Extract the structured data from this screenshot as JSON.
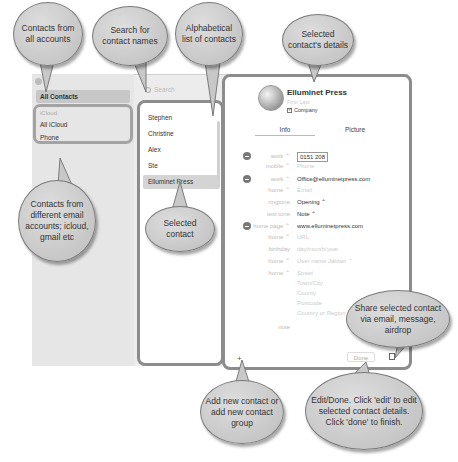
{
  "sidebar": {
    "all_contacts": "All Contacts",
    "group_header": "iCloud",
    "items": [
      {
        "label": "All iCloud"
      },
      {
        "label": "Phone"
      }
    ]
  },
  "search": {
    "placeholder": "Search"
  },
  "contact_list": {
    "items": [
      {
        "label": "Stephen"
      },
      {
        "label": "Christine"
      },
      {
        "label": "Alex"
      },
      {
        "label": "Ste"
      },
      {
        "label": "Elluminet Press",
        "selected": true
      }
    ]
  },
  "detail": {
    "name": "Elluminet Press",
    "subtitle": "First  Last",
    "company_label": "Company",
    "tabs": [
      {
        "label": "Info"
      },
      {
        "label": "Picture"
      }
    ],
    "rows": [
      {
        "removable": true,
        "label": "work ⌃",
        "value": "0151 208",
        "editing": true
      },
      {
        "removable": false,
        "label": "mobile ⌃",
        "value": "Phone",
        "placeholder": true
      },
      {
        "removable": true,
        "label": "work ⌃",
        "value": "Office@elluminetpress.com"
      },
      {
        "removable": false,
        "label": "home ⌃",
        "value": "Email",
        "placeholder": true
      },
      {
        "removable": false,
        "label": "ringtone",
        "value": "Opening ⌃"
      },
      {
        "removable": false,
        "label": "text tone",
        "value": "Note ⌃"
      },
      {
        "removable": true,
        "label": "home page ⌃",
        "value": "www.elluminetpress.com"
      },
      {
        "removable": false,
        "label": "home ⌃",
        "value": "URL",
        "placeholder": true
      },
      {
        "removable": false,
        "label": "birthday",
        "value": "day/month/year",
        "placeholder": true
      },
      {
        "removable": false,
        "label": "home ⌃",
        "value": "User name   Jabber ⌃",
        "placeholder": true
      },
      {
        "removable": false,
        "label": "home ⌃",
        "value": "Street",
        "placeholder": true
      },
      {
        "removable": false,
        "label": "",
        "value": "Town/City",
        "placeholder": true
      },
      {
        "removable": false,
        "label": "",
        "value": "County",
        "placeholder": true
      },
      {
        "removable": false,
        "label": "",
        "value": "Postcode",
        "placeholder": true
      },
      {
        "removable": false,
        "label": "",
        "value": "Country or Region",
        "placeholder": true
      },
      {
        "removable": false,
        "label": "note",
        "value": "",
        "placeholder": true
      }
    ]
  },
  "footer": {
    "add_label": "+",
    "done_label": "Done"
  },
  "callouts": {
    "all_accounts": "Contacts from all accounts",
    "search": "Search for contact names",
    "alphabetical": "Alphabetical list of contacts",
    "details": "Selected contact's details",
    "accounts": "Contacts from different email accounts; icloud, gmail etc",
    "selected": "Selected contact",
    "share": "Share selected contact via email, message, airdrop",
    "add": "Add new contact or add new contact group",
    "edit": "Edit/Done. Click 'edit' to edit selected contact details. Click 'done' to finish."
  }
}
